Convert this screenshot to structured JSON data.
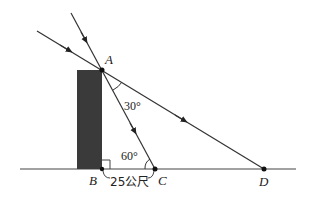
{
  "diagram": {
    "type": "geometry-sunlight-shadow",
    "points": {
      "A": {
        "label": "A",
        "x": 102,
        "y": 70
      },
      "B": {
        "label": "B",
        "x": 102,
        "y": 169
      },
      "C": {
        "label": "C",
        "x": 155,
        "y": 169
      },
      "D": {
        "label": "D",
        "x": 264,
        "y": 169
      }
    },
    "angles": {
      "at_A": "30°",
      "at_C": "60°"
    },
    "distance_BC": "25公尺",
    "right_angle_at": "B",
    "colors": {
      "stroke": "#333333",
      "building": "#3a3a3a"
    }
  }
}
